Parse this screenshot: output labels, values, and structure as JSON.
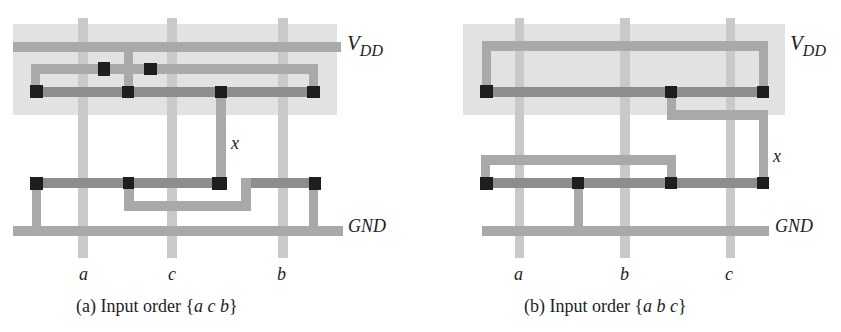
{
  "colors": {
    "well": "#e2e2e2",
    "poly": "#c9c9c9",
    "metal": "#a9a9a9",
    "diffusion": "#8d8d8d",
    "contact": "#1e1e1e",
    "text": "#222222"
  },
  "panel_a": {
    "caption_prefix": "(a) Input order {",
    "caption_order": "a c b",
    "caption_suffix": "}",
    "vdd_label": "V",
    "vdd_sub": "DD",
    "gnd_label": "GND",
    "node_label": "x",
    "inputs": [
      "a",
      "c",
      "b"
    ]
  },
  "panel_b": {
    "caption_prefix": "(b) Input order {",
    "caption_order": "a b c",
    "caption_suffix": "}",
    "vdd_label": "V",
    "vdd_sub": "DD",
    "gnd_label": "GND",
    "node_label": "x",
    "inputs": [
      "a",
      "b",
      "c"
    ]
  }
}
